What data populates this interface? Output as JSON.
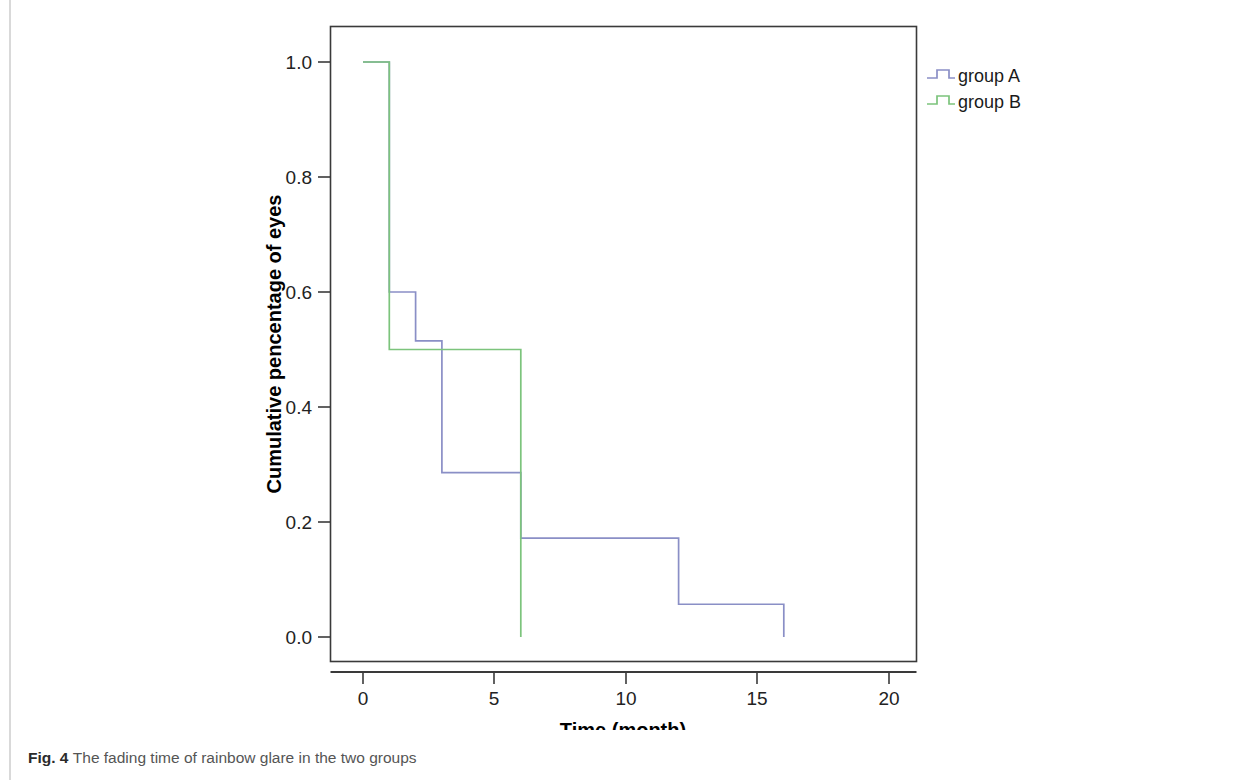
{
  "figure": {
    "caption_label": "Fig. 4",
    "caption_text": "The fading time of rainbow glare in the two groups"
  },
  "colors": {
    "group_a": "#8a8fc6",
    "group_b": "#7cc47c",
    "axis": "#3a3a3a",
    "frame": "#3a3a3a",
    "tick_label": "#222222",
    "axis_title": "#000000",
    "legend_text": "#1a1a1a",
    "page_rule": "#d9d9d9"
  },
  "legend": {
    "position": "right",
    "entries": [
      {
        "label": "group A",
        "color": "#8a8fc6",
        "marker": "step-line-icon"
      },
      {
        "label": "group B",
        "color": "#7cc47c",
        "marker": "step-line-icon"
      }
    ]
  },
  "axes": {
    "x_title": "Time (month)",
    "y_title": "Cumulative pencentage of eyes",
    "x_ticks": [
      "0",
      "5",
      "10",
      "15",
      "20"
    ],
    "y_ticks": [
      "0.0",
      "0.2",
      "0.4",
      "0.6",
      "0.8",
      "1.0"
    ]
  },
  "chart_data": {
    "type": "line",
    "subtype": "kaplan-meier-step",
    "title": "",
    "subtitle": "",
    "xlabel": "Time (month)",
    "ylabel": "Cumulative pencentage of eyes",
    "xlim": [
      0,
      21
    ],
    "ylim": [
      0.0,
      1.05
    ],
    "x_ticks": [
      0,
      5,
      10,
      15,
      20
    ],
    "y_ticks": [
      0.0,
      0.2,
      0.4,
      0.6,
      0.8,
      1.0
    ],
    "grid": false,
    "legend_position": "right",
    "series": [
      {
        "name": "group A",
        "color": "#8a8fc6",
        "steps": [
          {
            "x": 0,
            "y": 1.0
          },
          {
            "x": 1,
            "y": 0.6
          },
          {
            "x": 2,
            "y": 0.515
          },
          {
            "x": 3,
            "y": 0.286
          },
          {
            "x": 6,
            "y": 0.172
          },
          {
            "x": 12,
            "y": 0.057
          },
          {
            "x": 16,
            "y": 0.0
          }
        ]
      },
      {
        "name": "group B",
        "color": "#7cc47c",
        "steps": [
          {
            "x": 0,
            "y": 1.0
          },
          {
            "x": 1,
            "y": 0.5
          },
          {
            "x": 6,
            "y": 0.0
          }
        ]
      }
    ]
  }
}
